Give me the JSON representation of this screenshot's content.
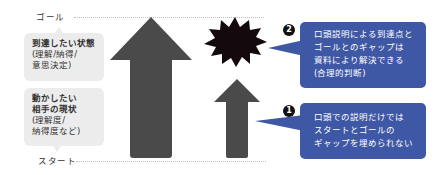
{
  "diagram": {
    "axis": {
      "goal_label": "ゴール",
      "start_label": "スタート"
    },
    "left_boxes": {
      "target_state": {
        "title": "到達したい状態",
        "detail_line1": "(理解/納得/",
        "detail_line2": "意思決定)"
      },
      "current_state": {
        "title_line1": "動かしたい",
        "title_line2": "相手の現状",
        "detail_line1": "(理解度/",
        "detail_line2": "納得度など)"
      }
    },
    "arrows": {
      "large": {
        "meaning": "documents reach the goal",
        "color": "#4a4a4a"
      },
      "small": {
        "meaning": "verbal explanation alone falls short",
        "color": "#4a4a4a"
      },
      "burst": {
        "meaning": "gap",
        "color": "#140a0e"
      }
    },
    "notes": [
      {
        "badge": "2",
        "line1": "口頭説明による到達点と",
        "line2": "ゴールとのギャップは",
        "line3": "資料により解決できる",
        "line4": "(合理的判断)"
      },
      {
        "badge": "1",
        "line1": "口頭での説明だけでは",
        "line2": "スタートとゴールの",
        "line3": "ギャップを埋められない"
      }
    ],
    "colors": {
      "note_blue": "#3f58a6",
      "box_gray": "#ececec",
      "arrow_gray": "#4a4a4a"
    }
  }
}
